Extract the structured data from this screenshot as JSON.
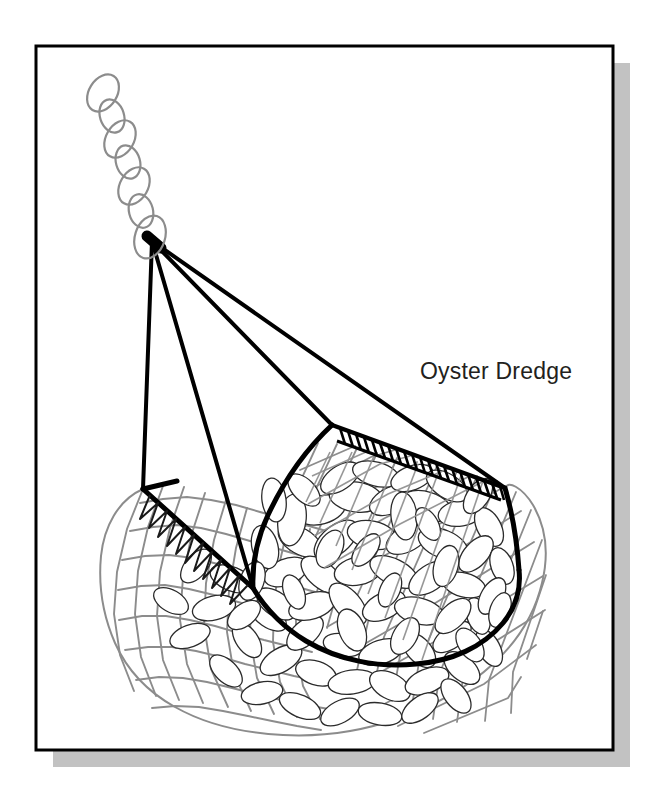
{
  "figure": {
    "kind": "technical-line-illustration",
    "caption": "Oyster Dredge",
    "background_color": "#ffffff",
    "frame": {
      "name": "picture-frame-border",
      "x": 36,
      "y": 46,
      "width": 577,
      "height": 704,
      "stroke_color": "#000000",
      "stroke_width": 3,
      "fill_color": "#ffffff"
    },
    "drop_shadow": {
      "name": "frame-drop-shadow",
      "offset_x": 17,
      "offset_y": 17,
      "color": "#c2c2c2"
    }
  },
  "caption_label": {
    "text": "Oyster Dredge",
    "x": 420,
    "y": 379,
    "font_size": 23,
    "color": "#231f20"
  },
  "parts": [
    {
      "id": "tow-chain",
      "label": "Tow Chain",
      "description": "Interlocking oval chain links ascending to upper left",
      "link_count": 6,
      "stroke_color": "#8c8c8c",
      "stroke_width": 2.2
    },
    {
      "id": "bridle-cables",
      "label": "Bridle Cables",
      "description": "Four heavy tow cables converging at the chain shackle",
      "count": 4,
      "apex_x": 152,
      "apex_y": 241,
      "stroke_color": "#000000",
      "stroke_width": 4
    },
    {
      "id": "dredge-frame",
      "label": "Dredge Frame",
      "description": "Heavy black curved frame bar forming the mouth and bag rim",
      "stroke_color": "#000000",
      "stroke_width": 5
    },
    {
      "id": "scraper-bar",
      "label": "Scraper Bar Teeth",
      "description": "Row of rectangular scraping teeth along the leading edge",
      "tooth_count": 22,
      "stroke_color": "#000000",
      "stroke_width": 3
    },
    {
      "id": "net-bag",
      "label": "Chain Mesh Net Bag",
      "description": "Gray mesh bag; square weave on the left flank, diagonal weave across the mouth",
      "stroke_color": "#8c8c8c",
      "stroke_width": 2
    },
    {
      "id": "lacing",
      "label": "Net Lacing",
      "description": "Zigzag lacing stitching the net to the lower frame bar",
      "stroke_color": "#1a1a1a",
      "stroke_width": 2
    },
    {
      "id": "oyster-catch",
      "label": "Oyster Catch",
      "description": "Heap of oval oyster shells filling the bag",
      "shell_count": 120,
      "fill_color": "#ffffff",
      "stroke_color": "#2b2b2b",
      "stroke_width": 1.3
    }
  ],
  "palette": {
    "ink": "#000000",
    "soft_ink": "#2b2b2b",
    "net_gray": "#8c8c8c",
    "chain_gray": "#8c8c8c",
    "shadow_gray": "#c2c2c2",
    "paper": "#ffffff"
  }
}
